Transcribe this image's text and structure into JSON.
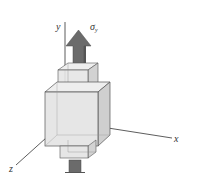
{
  "diagram": {
    "type": "stress-element-uniaxial",
    "axes": {
      "x_label": "x",
      "y_label": "y",
      "z_label": "z"
    },
    "stress_label": {
      "symbol": "σ",
      "subscript": "y"
    },
    "colors": {
      "arrow": "#6b6b6b",
      "cube_face_front": "#e6e6e6",
      "cube_face_top": "#eeeeee",
      "cube_face_side": "#d2d2d2",
      "edge": "#555555",
      "axis": "#333333"
    }
  }
}
